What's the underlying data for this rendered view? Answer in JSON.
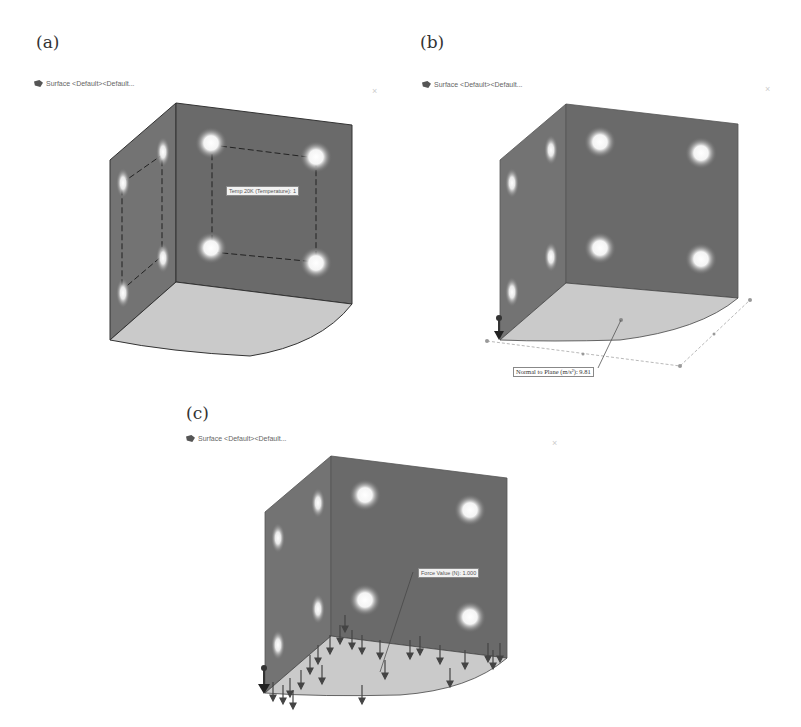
{
  "panels": [
    {
      "id": "a",
      "label": "(a)",
      "tree_item": "Surface <Default><Default...",
      "callout": "Temp 20K (Temperature): 1",
      "description": "Cube with two visible walls, four heat sources on front wall and four on side wall, dashed selection outline, curved floor"
    },
    {
      "id": "b",
      "label": "(b)",
      "tree_item": "Surface <Default><Default...",
      "callout": "Normal to Plane (m/s²): 9.81",
      "description": "Cube with gravity applied normal to floor plane, plane outline with handles"
    },
    {
      "id": "c",
      "label": "(c)",
      "tree_item": "Surface <Default><Default...",
      "callout": "Force Value (N): 1.000",
      "description": "Cube with force arrows distributed over floor surface"
    }
  ],
  "close_glyph": "×",
  "colors": {
    "wall": "#6a6a6a",
    "wall_side": "#737373",
    "floor": "#c9c9c9",
    "edge": "#333333",
    "source": "#ffffff"
  }
}
